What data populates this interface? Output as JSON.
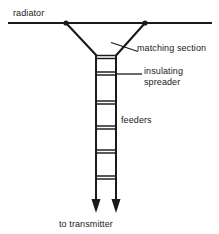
{
  "diagram": {
    "type": "line-drawing",
    "stroke_color": "#1a1a1a",
    "background_color": "#ffffff",
    "labels": {
      "radiator": "radiator",
      "matching_section": "matching section",
      "insulating_line1": "insulating",
      "insulating_line2": "spreader",
      "feeders": "feeders",
      "to_transmitter": "to transmitter"
    },
    "geometry": {
      "radiator_line": {
        "x1": 8,
        "y1": 23,
        "x2": 212,
        "y2": 23
      },
      "tap_points": [
        {
          "x": 66,
          "y": 23
        },
        {
          "x": 145,
          "y": 23
        }
      ],
      "matching_legs": [
        {
          "x1": 66,
          "y1": 23,
          "x2": 97,
          "y2": 55
        },
        {
          "x1": 145,
          "y1": 23,
          "x2": 116,
          "y2": 55
        }
      ],
      "feeder_rails": [
        {
          "x": 96,
          "y_top": 55,
          "y_bottom": 199
        },
        {
          "x": 116,
          "y_top": 55,
          "y_bottom": 199
        }
      ],
      "spreaders_y": [
        55,
        58,
        72,
        75,
        101,
        104,
        126,
        129,
        150,
        153,
        176,
        179
      ],
      "arrow_heads": [
        {
          "x": 96,
          "y": 212
        },
        {
          "x": 116,
          "y": 212
        }
      ],
      "leader_matching_section": {
        "x1": 112,
        "y1": 43,
        "x2": 137,
        "y2": 51
      },
      "leader_insulating": {
        "x1": 116,
        "y1": 74,
        "x2": 141,
        "y2": 74
      }
    }
  }
}
